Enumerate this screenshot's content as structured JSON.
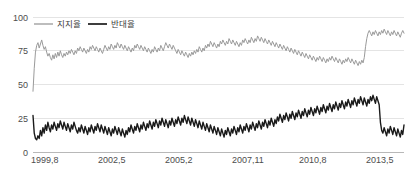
{
  "chart_data": {
    "type": "line",
    "title": "",
    "subtitle": "",
    "xlabel": "",
    "ylabel": "",
    "ylim": [
      0,
      100
    ],
    "yticks": [
      0,
      25,
      50,
      75,
      100
    ],
    "ytick_labels": [
      "0",
      "25",
      "50",
      "75",
      "100"
    ],
    "xtick_labels": [
      "1999,8",
      "2002,5",
      "2005,2",
      "2007,11",
      "2010,8",
      "2013,5"
    ],
    "xtick_positions": [
      0,
      54,
      108,
      162,
      216,
      270
    ],
    "grid": true,
    "grid_color": "#d9d9d9",
    "legend_position": "top-left",
    "x_count": 300,
    "legend": [
      {
        "name": "지지율",
        "color": "#9a9a9a",
        "width": 1.0
      },
      {
        "name": "반대율",
        "color": "#1a1a1a",
        "width": 1.4
      }
    ],
    "series": [
      {
        "name": "지지율",
        "color": "#9a9a9a",
        "values": [
          45,
          62,
          74,
          79,
          81,
          77,
          80,
          83,
          79,
          76,
          78,
          74,
          71,
          73,
          70,
          68,
          72,
          69,
          73,
          70,
          74,
          71,
          75,
          72,
          70,
          73,
          71,
          74,
          72,
          75,
          73,
          76,
          74,
          72,
          75,
          73,
          77,
          75,
          78,
          76,
          74,
          77,
          75,
          73,
          76,
          74,
          78,
          76,
          79,
          77,
          75,
          78,
          76,
          74,
          77,
          75,
          73,
          76,
          79,
          77,
          75,
          78,
          76,
          80,
          78,
          76,
          79,
          77,
          81,
          79,
          77,
          80,
          78,
          76,
          79,
          77,
          75,
          78,
          76,
          74,
          77,
          75,
          79,
          77,
          80,
          78,
          76,
          79,
          77,
          75,
          78,
          76,
          74,
          77,
          75,
          73,
          76,
          74,
          78,
          76,
          74,
          77,
          75,
          79,
          77,
          75,
          78,
          81,
          79,
          77,
          80,
          78,
          76,
          79,
          77,
          75,
          73,
          76,
          74,
          72,
          75,
          73,
          71,
          74,
          72,
          70,
          73,
          71,
          74,
          72,
          75,
          73,
          76,
          74,
          78,
          76,
          74,
          77,
          75,
          79,
          77,
          80,
          78,
          82,
          80,
          78,
          81,
          79,
          77,
          80,
          78,
          82,
          80,
          83,
          81,
          79,
          82,
          80,
          84,
          82,
          80,
          83,
          81,
          79,
          82,
          80,
          78,
          81,
          79,
          83,
          81,
          84,
          82,
          80,
          83,
          81,
          85,
          83,
          81,
          84,
          82,
          86,
          84,
          82,
          85,
          83,
          81,
          84,
          82,
          80,
          83,
          81,
          79,
          82,
          80,
          78,
          81,
          79,
          77,
          80,
          78,
          76,
          79,
          77,
          75,
          78,
          76,
          74,
          77,
          75,
          73,
          76,
          74,
          72,
          75,
          73,
          71,
          74,
          72,
          70,
          73,
          71,
          69,
          72,
          70,
          68,
          71,
          69,
          67,
          70,
          68,
          71,
          69,
          67,
          70,
          68,
          66,
          69,
          67,
          70,
          68,
          71,
          69,
          67,
          70,
          68,
          66,
          69,
          67,
          65,
          68,
          66,
          69,
          67,
          70,
          68,
          66,
          69,
          67,
          65,
          68,
          66,
          64,
          67,
          65,
          68,
          66,
          70,
          78,
          84,
          88,
          90,
          88,
          86,
          89,
          87,
          90,
          88,
          86,
          89,
          87,
          90,
          88,
          91,
          89,
          87,
          90,
          88,
          86,
          89,
          87,
          90,
          88,
          86,
          89,
          87,
          85,
          88,
          90,
          88
        ]
      },
      {
        "name": "반대율",
        "color": "#1a1a1a",
        "values": [
          27,
          14,
          10,
          9,
          12,
          10,
          16,
          12,
          18,
          14,
          20,
          16,
          22,
          18,
          15,
          20,
          17,
          22,
          19,
          16,
          21,
          18,
          23,
          20,
          17,
          22,
          19,
          16,
          21,
          18,
          15,
          20,
          17,
          22,
          19,
          16,
          14,
          18,
          15,
          20,
          17,
          14,
          19,
          16,
          13,
          18,
          15,
          20,
          17,
          14,
          19,
          16,
          21,
          18,
          15,
          20,
          17,
          14,
          19,
          16,
          13,
          18,
          15,
          12,
          17,
          14,
          19,
          16,
          13,
          18,
          15,
          12,
          17,
          14,
          11,
          16,
          13,
          18,
          15,
          20,
          17,
          14,
          19,
          16,
          21,
          18,
          15,
          20,
          17,
          22,
          19,
          16,
          21,
          18,
          23,
          20,
          17,
          22,
          19,
          24,
          21,
          18,
          23,
          20,
          25,
          22,
          19,
          24,
          21,
          18,
          23,
          20,
          25,
          22,
          19,
          24,
          21,
          26,
          23,
          20,
          25,
          22,
          27,
          24,
          21,
          26,
          23,
          20,
          25,
          22,
          19,
          24,
          21,
          18,
          23,
          20,
          17,
          22,
          19,
          16,
          21,
          18,
          15,
          20,
          17,
          14,
          19,
          16,
          13,
          18,
          15,
          12,
          17,
          14,
          11,
          16,
          13,
          18,
          15,
          12,
          17,
          14,
          19,
          16,
          13,
          18,
          15,
          20,
          17,
          14,
          19,
          16,
          21,
          18,
          15,
          20,
          17,
          22,
          19,
          16,
          21,
          18,
          23,
          20,
          17,
          22,
          19,
          24,
          21,
          18,
          23,
          20,
          25,
          22,
          19,
          24,
          21,
          26,
          23,
          28,
          25,
          22,
          27,
          24,
          29,
          26,
          23,
          28,
          25,
          30,
          27,
          24,
          29,
          26,
          31,
          28,
          25,
          30,
          27,
          32,
          29,
          26,
          31,
          28,
          33,
          30,
          27,
          32,
          29,
          34,
          31,
          28,
          33,
          30,
          35,
          32,
          29,
          34,
          31,
          36,
          33,
          30,
          35,
          32,
          37,
          34,
          31,
          36,
          33,
          38,
          35,
          32,
          37,
          34,
          39,
          36,
          33,
          38,
          35,
          40,
          37,
          34,
          39,
          36,
          41,
          38,
          35,
          40,
          37,
          34,
          39,
          36,
          41,
          38,
          42,
          39,
          36,
          41,
          38,
          35,
          22,
          16,
          14,
          18,
          15,
          12,
          17,
          14,
          19,
          16,
          13,
          18,
          15,
          12,
          17,
          14,
          11,
          16,
          13,
          20
        ]
      }
    ]
  },
  "plot": {
    "left": 33,
    "top": 17,
    "right": 404,
    "bottom": 152
  }
}
